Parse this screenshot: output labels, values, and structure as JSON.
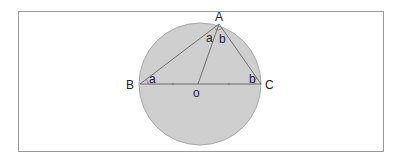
{
  "diagram": {
    "colors": {
      "circle_fill": "#cfcfcf",
      "circle_stroke": "#a8a8a8",
      "line": "#6f6f6f",
      "frame": "#9a9a9a",
      "text": "#222222"
    },
    "circle": {
      "cx": 200,
      "cy": 84,
      "r": 61
    },
    "points": {
      "A": {
        "label": "A",
        "x": 219,
        "y": 24
      },
      "B": {
        "label": "B",
        "x": 140,
        "y": 84
      },
      "C": {
        "label": "C",
        "x": 261,
        "y": 84
      },
      "O": {
        "label": "o",
        "x": 198,
        "y": 84
      }
    },
    "angle_labels": {
      "at_B": "a",
      "at_C": "b",
      "at_A_left": "a",
      "at_A_right": "b"
    },
    "tick_marks": [
      {
        "x": 173,
        "y": 84
      },
      {
        "x": 229,
        "y": 84
      }
    ]
  }
}
